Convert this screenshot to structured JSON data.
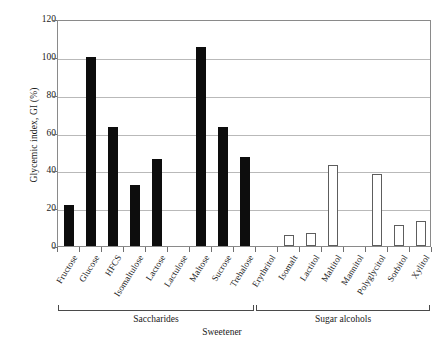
{
  "chart_data": {
    "type": "bar",
    "title": "",
    "xlabel": "Sweetener",
    "ylabel": "Glycemic index, GI (%)",
    "ylim": [
      0,
      120
    ],
    "ytick_step": 20,
    "yticks": [
      0,
      20,
      40,
      60,
      80,
      100,
      120
    ],
    "ytick_labels": [
      "0",
      "20",
      "40",
      "60",
      "80",
      "100",
      "120"
    ],
    "grid": true,
    "legend": "none",
    "categories": [
      "Fructose",
      "Glucose",
      "HFCS",
      "Isomaltulose",
      "Lactose",
      "Lactulose",
      "Maltose",
      "Sucrose",
      "Trehalose",
      "Erythritol",
      "Isomalt",
      "Lactitol",
      "Maltitol",
      "Mannitol",
      "Polyglycitol",
      "Sorbitol",
      "Xylitol"
    ],
    "values": [
      21.5,
      100,
      63,
      32,
      46,
      0,
      105,
      63,
      47,
      0,
      6,
      7,
      43,
      0,
      38,
      11,
      13
    ],
    "bar_styles": [
      "filled",
      "filled",
      "filled",
      "filled",
      "filled",
      "filled",
      "filled",
      "filled",
      "filled",
      "hollow",
      "hollow",
      "hollow",
      "hollow",
      "hollow",
      "hollow",
      "hollow",
      "hollow"
    ],
    "groups": [
      {
        "label": "Saccharides",
        "start_index": 0,
        "end_index": 8
      },
      {
        "label": "Sugar alcohols",
        "start_index": 9,
        "end_index": 16
      }
    ],
    "colors": {
      "filled_bar": "#0d0d0d",
      "hollow_bar_fill": "#ffffff",
      "hollow_bar_edge": "#5d5d5d",
      "gridline": "#b9b9b9",
      "axis": "#8a8a8a",
      "text": "#1a1a1a"
    }
  }
}
